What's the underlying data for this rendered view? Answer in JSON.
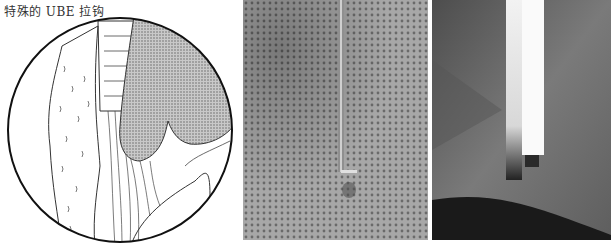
{
  "figure": {
    "caption": "特殊的 UBE 拉钩",
    "panels": [
      {
        "type": "illustration",
        "description": "circular endoscopic view drawing with stippled shaded structure"
      },
      {
        "type": "photo",
        "description": "thin instrument against perforated drape"
      },
      {
        "type": "photo",
        "description": "close-up of retractor tip against drape"
      }
    ]
  }
}
